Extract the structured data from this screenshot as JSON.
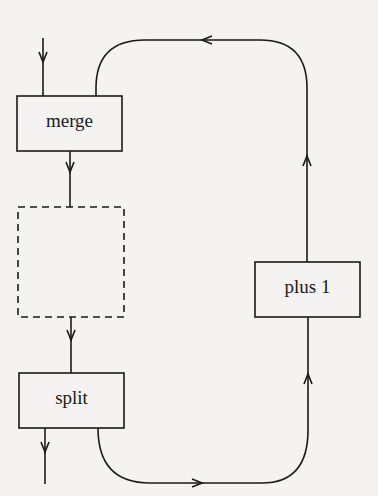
{
  "diagram": {
    "nodes": [
      {
        "id": "merge",
        "label": "merge",
        "style": "solid"
      },
      {
        "id": "placeholder",
        "label": "",
        "style": "dashed"
      },
      {
        "id": "split",
        "label": "split",
        "style": "solid"
      },
      {
        "id": "plus1",
        "label": "plus 1",
        "style": "solid"
      }
    ],
    "edges": [
      {
        "from": "input",
        "to": "merge"
      },
      {
        "from": "merge",
        "to": "placeholder"
      },
      {
        "from": "placeholder",
        "to": "split"
      },
      {
        "from": "split",
        "to": "output"
      },
      {
        "from": "split",
        "to": "plus1"
      },
      {
        "from": "plus1",
        "to": "merge"
      }
    ],
    "colors": {
      "stroke": "#1a1a1a",
      "background": "#f4f3f1"
    }
  }
}
